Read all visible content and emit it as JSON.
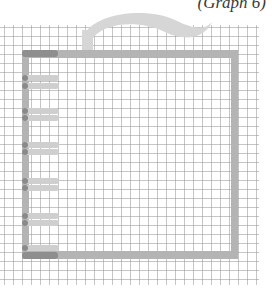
{
  "caption": "(Graph 6)",
  "colors": {
    "frame": "#b4b4b4",
    "frame_dark": "#8e8e8e",
    "tab": "#cfcfcf",
    "grid_line": "#969696",
    "swoosh": "#d6d6d6"
  },
  "illustration": {
    "description": "Hand-drawn frame on graph paper with a curved swoosh above and tab markers along the left edge",
    "tabs_count": 12
  }
}
